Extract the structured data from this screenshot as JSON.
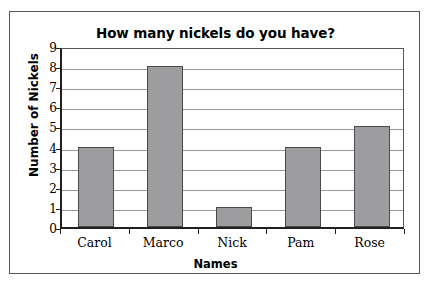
{
  "figure": {
    "frame_color": "#58585a",
    "background": "#ffffff"
  },
  "chart_data": {
    "type": "bar",
    "title": "How many nickels do you have?",
    "xlabel": "Names",
    "ylabel": "Number of Nickels",
    "categories": [
      "Carol",
      "Marco",
      "Nick",
      "Pam",
      "Rose"
    ],
    "values": [
      4,
      8,
      1,
      4,
      5
    ],
    "ylim": [
      0,
      9
    ],
    "ytick_labels": [
      "0",
      "1",
      "2",
      "3",
      "4",
      "5",
      "6",
      "7",
      "8",
      "9"
    ],
    "ytick_values": [
      0,
      1,
      2,
      3,
      4,
      5,
      6,
      7,
      8,
      9
    ],
    "ystep": 1,
    "grid": "horizontal",
    "legend": "none",
    "bar_fill_color": "#9d9d9f",
    "bar_edge_color": "#4a4a4c",
    "gridline_color": "#9a9a9c",
    "axis_color": "#231f20"
  }
}
